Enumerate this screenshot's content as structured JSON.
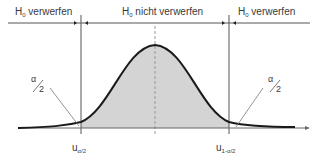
{
  "diagram": {
    "type": "two-sided hypothesis test, normal distribution",
    "regions": [
      {
        "label_main": "H",
        "label_sub": "0",
        "label_rest": " verwerfen"
      },
      {
        "label_main": "H",
        "label_sub": "0",
        "label_rest": " nicht verwerfen"
      },
      {
        "label_main": "H",
        "label_sub": "0",
        "label_rest": " verwerfen"
      }
    ],
    "tail_labels": {
      "left": {
        "num": "α",
        "den": "2"
      },
      "right": {
        "num": "α",
        "den": "2"
      }
    },
    "critical_values": {
      "left": {
        "main": "u",
        "sub_num": "α",
        "sub_den": "2"
      },
      "right": {
        "main": "u",
        "sub_num": "1-α",
        "sub_den": "2"
      }
    },
    "colors": {
      "curve": "#1a1a1a",
      "fill": "#d0d0d0",
      "lines": "#555555"
    }
  }
}
